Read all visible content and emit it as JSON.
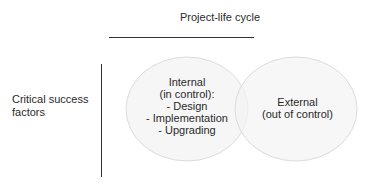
{
  "diagram": {
    "column_header": "Project-life cycle",
    "row_label": "Critical success factors",
    "sets": [
      {
        "name": "internal",
        "lines": [
          "Internal",
          "(in control):",
          "- Design",
          "- Implementation",
          "- Upgrading"
        ]
      },
      {
        "name": "external",
        "lines": [
          "External",
          "(out of control)"
        ]
      }
    ],
    "colors": {
      "circle_fill": "#f4f4f4",
      "circle_stroke": "#dcdcdc",
      "line": "#333333",
      "text": "#2a2a2a"
    }
  }
}
